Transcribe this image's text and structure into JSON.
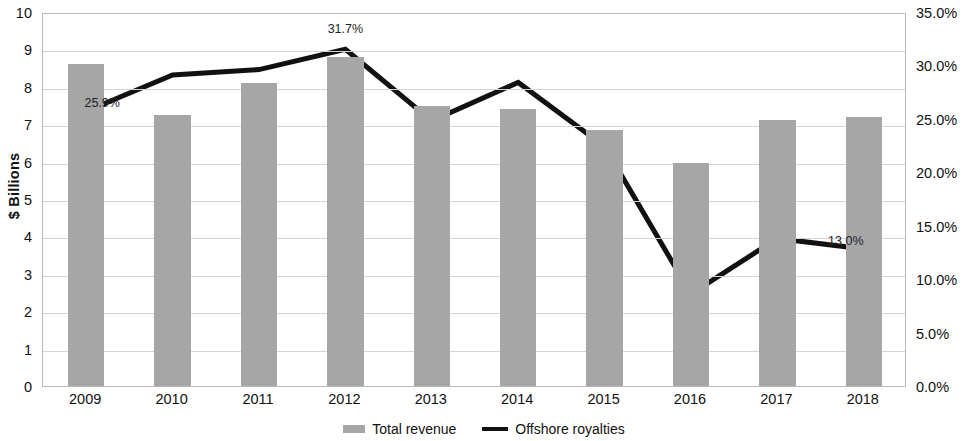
{
  "chart_data": {
    "type": "bar",
    "title": "",
    "subtitle": "",
    "xlabel": "",
    "ylabel": "$ Billions",
    "y2label": "",
    "categories": [
      "2009",
      "2010",
      "2011",
      "2012",
      "2013",
      "2014",
      "2015",
      "2016",
      "2017",
      "2018"
    ],
    "ylim": [
      0,
      10
    ],
    "y2lim": [
      0,
      35
    ],
    "grid": true,
    "legend_position": "bottom-center",
    "y_ticks": [
      "0",
      "1",
      "2",
      "3",
      "4",
      "5",
      "6",
      "7",
      "8",
      "9",
      "10"
    ],
    "y_tick_values": [
      0,
      1,
      2,
      3,
      4,
      5,
      6,
      7,
      8,
      9,
      10
    ],
    "y2_ticks": [
      "0.0%",
      "5.0%",
      "10.0%",
      "15.0%",
      "20.0%",
      "25.0%",
      "30.0%",
      "35.0%"
    ],
    "y2_tick_values": [
      0,
      5,
      10,
      15,
      20,
      25,
      30,
      35
    ],
    "series": [
      {
        "name": "Total revenue",
        "type": "bar",
        "axis": "left",
        "unit": "$ Billions",
        "color": "#a6a6a6",
        "values": [
          8.6,
          7.25,
          8.1,
          8.8,
          7.5,
          7.4,
          6.85,
          5.95,
          7.1,
          7.2
        ]
      },
      {
        "name": "Offshore royalties",
        "type": "line",
        "axis": "right",
        "unit": "%",
        "color": "#111111",
        "values": [
          25.9,
          29.3,
          29.8,
          31.7,
          25.0,
          28.6,
          22.6,
          8.8,
          14.0,
          13.0
        ]
      }
    ],
    "annotations": [
      {
        "category": "2009",
        "text": "25.9%",
        "series": "Offshore royalties",
        "value": 25.9
      },
      {
        "category": "2012",
        "text": "31.7%",
        "series": "Offshore royalties",
        "value": 31.7
      },
      {
        "category": "2018",
        "text": "13.0%",
        "series": "Offshore royalties",
        "value": 13.0
      }
    ]
  },
  "legend": {
    "items": [
      {
        "label": "Total revenue",
        "marker": "bar-swatch",
        "color": "#a6a6a6"
      },
      {
        "label": "Offshore royalties",
        "marker": "line-swatch",
        "color": "#111111"
      }
    ]
  }
}
